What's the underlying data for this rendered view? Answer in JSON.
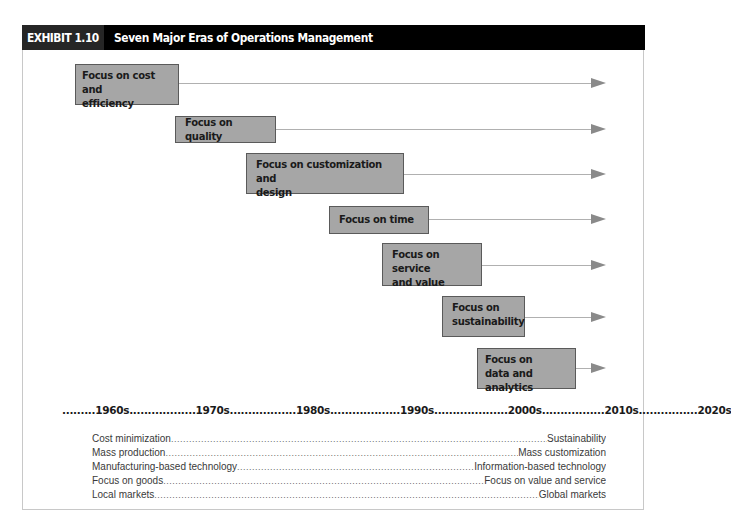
{
  "exhibit": {
    "label": "EXHIBIT 1.10",
    "title": "Seven Major Eras of Operations Management"
  },
  "eras": [
    {
      "label": "Focus on cost and efficiency",
      "line1": "Focus on cost and",
      "line2": "efficiency"
    },
    {
      "label": "Focus on quality",
      "line1": "Focus on quality",
      "line2": ""
    },
    {
      "label": "Focus on customization and design",
      "line1": "Focus on customization and",
      "line2": "design"
    },
    {
      "label": "Focus on time",
      "line1": "Focus on time",
      "line2": ""
    },
    {
      "label": "Focus on service and value",
      "line1": "Focus on service",
      "line2": "and value"
    },
    {
      "label": "Focus on sustainability",
      "line1": "Focus on",
      "line2": "sustainability"
    },
    {
      "label": "Focus on data and analytics",
      "line1": "Focus on",
      "line2": "data and analytics"
    }
  ],
  "timeline": {
    "text": ".........1960s..................1970s..................1980s...................1990s....................2000s.................2010s................2020s",
    "decades": [
      "1960s",
      "1970s",
      "1980s",
      "1990s",
      "2000s",
      "2010s",
      "2020s"
    ]
  },
  "shifts": [
    {
      "from": "Cost minimization",
      "to": "Sustainability"
    },
    {
      "from": "Mass production",
      "to": "Mass customization"
    },
    {
      "from": "Manufacturing-based technology",
      "to": "Information-based technology"
    },
    {
      "from": "Focus on goods",
      "to": "Focus on value and service"
    },
    {
      "from": "Local markets",
      "to": "Global markets"
    }
  ],
  "colors": {
    "header_bg": "#000000",
    "label_bg": "#262626",
    "box_fill": "#a6a6a6",
    "box_border": "#5a5a5a",
    "arrow": "#8a8a8a"
  }
}
